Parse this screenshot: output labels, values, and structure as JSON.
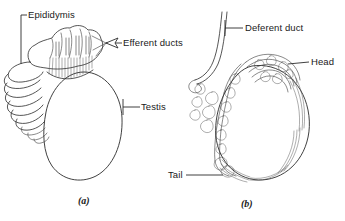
{
  "figure": {
    "background_color": "#ffffff",
    "ink_color": "#2b2b2b",
    "panels": [
      {
        "caption": "(a)",
        "labels": [
          {
            "name": "epididymis",
            "text": "Epididymis"
          },
          {
            "name": "efferent-ducts",
            "text": "Efferent ducts"
          },
          {
            "name": "testis",
            "text": "Testis"
          }
        ]
      },
      {
        "caption": "(b)",
        "labels": [
          {
            "name": "deferent-duct",
            "text": "Deferent duct"
          },
          {
            "name": "head",
            "text": "Head"
          },
          {
            "name": "tail",
            "text": "Tail"
          }
        ]
      }
    ]
  },
  "labels": {
    "epididymis": "Epididymis",
    "efferent_ducts": "Efferent ducts",
    "testis": "Testis",
    "deferent_duct": "Deferent duct",
    "head": "Head",
    "tail": "Tail"
  },
  "captions": {
    "panel_a": "(a)",
    "panel_b": "(b)"
  }
}
